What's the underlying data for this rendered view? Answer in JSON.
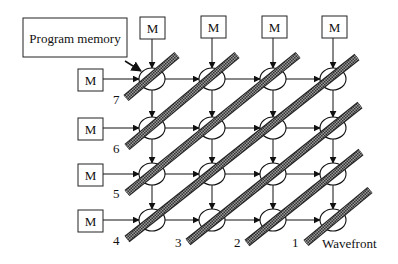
{
  "diagram": {
    "title_box": {
      "label": "Program memory",
      "x": 23,
      "y": 18,
      "w": 104,
      "h": 39
    },
    "memory_label": "M",
    "columns_x": [
      152,
      212,
      273,
      333
    ],
    "rows_y": [
      79,
      128,
      174,
      220
    ],
    "node": {
      "rx": 13,
      "ry": 11
    },
    "top_memories": [
      {
        "label": "M",
        "x": 140,
        "y": 17
      },
      {
        "label": "M",
        "x": 201,
        "y": 16
      },
      {
        "label": "M",
        "x": 262,
        "y": 16
      },
      {
        "label": "M",
        "x": 322,
        "y": 16
      }
    ],
    "left_memories": [
      {
        "label": "M",
        "x": 78,
        "y": 69
      },
      {
        "label": "M",
        "x": 78,
        "y": 118
      },
      {
        "label": "M",
        "x": 78,
        "y": 164
      },
      {
        "label": "M",
        "x": 78,
        "y": 210
      }
    ],
    "memory_box": {
      "w": 25,
      "h": 22
    },
    "wavefronts": [
      {
        "label": "7",
        "x1": 126,
        "y1": 98,
        "x2": 177,
        "y2": 55,
        "lx": 113,
        "ly": 104
      },
      {
        "label": "6",
        "x1": 127,
        "y1": 147,
        "x2": 237,
        "y2": 55,
        "lx": 113,
        "ly": 153
      },
      {
        "label": "5",
        "x1": 127,
        "y1": 193,
        "x2": 298,
        "y2": 55,
        "lx": 113,
        "ly": 198
      },
      {
        "label": "4",
        "x1": 127,
        "y1": 239,
        "x2": 357,
        "y2": 57,
        "lx": 113,
        "ly": 245
      },
      {
        "label": "3",
        "x1": 188,
        "y1": 242,
        "x2": 360,
        "y2": 105,
        "lx": 175,
        "ly": 247
      },
      {
        "label": "2",
        "x1": 247,
        "y1": 243,
        "x2": 361,
        "y2": 152,
        "lx": 234,
        "ly": 247
      },
      {
        "label": "1",
        "x1": 306,
        "y1": 243,
        "x2": 370,
        "y2": 190,
        "lx": 292,
        "ly": 247
      }
    ],
    "wavefront_label": {
      "text": "Wavefront",
      "x": 322,
      "y": 248
    },
    "colors": {
      "line": "#111111",
      "band_fill": "#777777",
      "band_stroke": "#222222"
    }
  }
}
